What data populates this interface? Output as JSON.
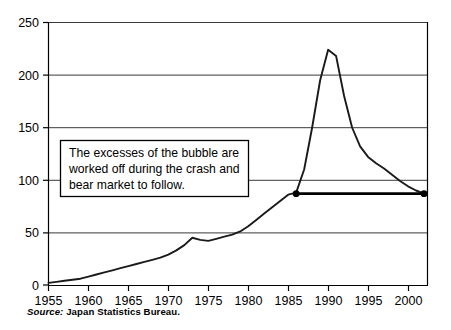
{
  "chart_data": {
    "type": "line",
    "title": "",
    "xlabel": "",
    "ylabel": "",
    "xlim": [
      1955,
      2002.5
    ],
    "ylim": [
      0,
      250
    ],
    "grid": true,
    "legend": "none",
    "x_ticks": [
      "1955",
      "1960",
      "1965",
      "1970",
      "1975",
      "1980",
      "1985",
      "1990",
      "1995",
      "2000"
    ],
    "y_ticks": [
      "0",
      "50",
      "100",
      "150",
      "200",
      "250"
    ],
    "series": [
      {
        "name": "Japan land price index",
        "x": [
          1955,
          1956,
          1957,
          1958,
          1959,
          1960,
          1961,
          1962,
          1963,
          1964,
          1965,
          1966,
          1967,
          1968,
          1969,
          1970,
          1971,
          1972,
          1973,
          1974,
          1975,
          1976,
          1977,
          1978,
          1979,
          1980,
          1981,
          1982,
          1983,
          1984,
          1985,
          1986,
          1987,
          1988,
          1989,
          1990,
          1991,
          1992,
          1993,
          1994,
          1995,
          1996,
          1997,
          1998,
          1999,
          2000,
          2001,
          2002
        ],
        "values": [
          2,
          3,
          4,
          5,
          6,
          8,
          10,
          12,
          14,
          16,
          18,
          20,
          22,
          24,
          26,
          29,
          33,
          38,
          45,
          43,
          42,
          44,
          46,
          48,
          51,
          56,
          62,
          68,
          74,
          80,
          86,
          88,
          110,
          150,
          195,
          224,
          218,
          180,
          150,
          132,
          122,
          116,
          111,
          105,
          99,
          94,
          90,
          87
        ]
      }
    ],
    "annotations": [
      {
        "name": "callout-box",
        "lines": [
          "The excesses of the bubble are",
          "worked off during the crash and",
          "bear market to follow."
        ]
      },
      {
        "name": "level-line",
        "start_year": 1986,
        "end_year": 2002,
        "value": 87,
        "markers": 2
      }
    ]
  },
  "source": {
    "label": "Source:",
    "text": "Japan Statistics Bureau."
  }
}
